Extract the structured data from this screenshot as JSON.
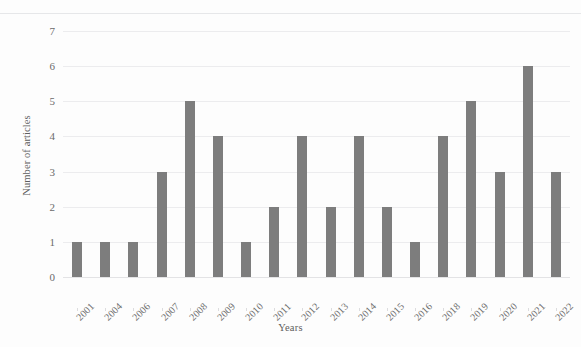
{
  "chart_data": {
    "type": "bar",
    "title": "",
    "subtitle": "",
    "xlabel": "Years",
    "ylabel": "Number of articles",
    "categories": [
      "2001",
      "2004",
      "2006",
      "2007",
      "2008",
      "2009",
      "2010",
      "2011",
      "2012",
      "2013",
      "2014",
      "2015",
      "2016",
      "2018",
      "2019",
      "2020",
      "2021",
      "2022"
    ],
    "values": [
      1,
      1,
      1,
      3,
      5,
      4,
      1,
      2,
      4,
      2,
      4,
      2,
      1,
      4,
      5,
      3,
      6,
      3
    ],
    "series": [
      {
        "name": "Number of articles",
        "values": [
          1,
          1,
          1,
          3,
          5,
          4,
          1,
          2,
          4,
          2,
          4,
          2,
          1,
          4,
          5,
          3,
          6,
          3
        ]
      }
    ],
    "ylim": [
      0,
      7
    ],
    "yticks": [
      0,
      1,
      2,
      3,
      4,
      5,
      6,
      7
    ],
    "ytick_labels": [
      "0",
      "1",
      "2",
      "3",
      "4",
      "5",
      "6",
      "7"
    ],
    "grid": true,
    "grid_axis": "y",
    "legend": false,
    "legend_position": "none",
    "bar_color": "#7d7d7d",
    "grid_color": "#ececee",
    "background_color": "#fdfdfd",
    "axis_text_color": "#6a6a6a",
    "annotations": []
  }
}
